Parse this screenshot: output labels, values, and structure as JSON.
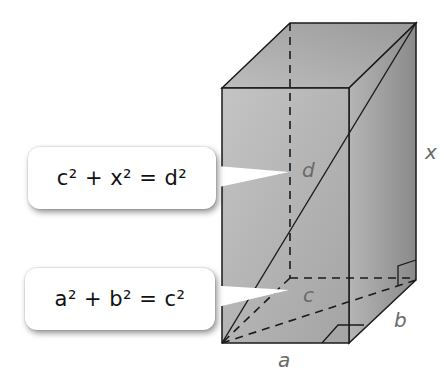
{
  "figure": {
    "type": "rectangular prism with diagonals",
    "colors": {
      "front_face": "#b9b9b9",
      "top_face": "#a9a9a9",
      "side_face": "#8f8f8f",
      "edge": "#1a1a1a",
      "label": "#6a6a6a",
      "callout_bg": "#ffffff"
    },
    "labels": {
      "a": "a",
      "b": "b",
      "c": "c",
      "d": "d",
      "x": "x"
    }
  },
  "callouts": [
    {
      "id": "diagonal-d",
      "text": "c² + x² = d²"
    },
    {
      "id": "diagonal-c",
      "text": "a² + b² = c²"
    }
  ]
}
